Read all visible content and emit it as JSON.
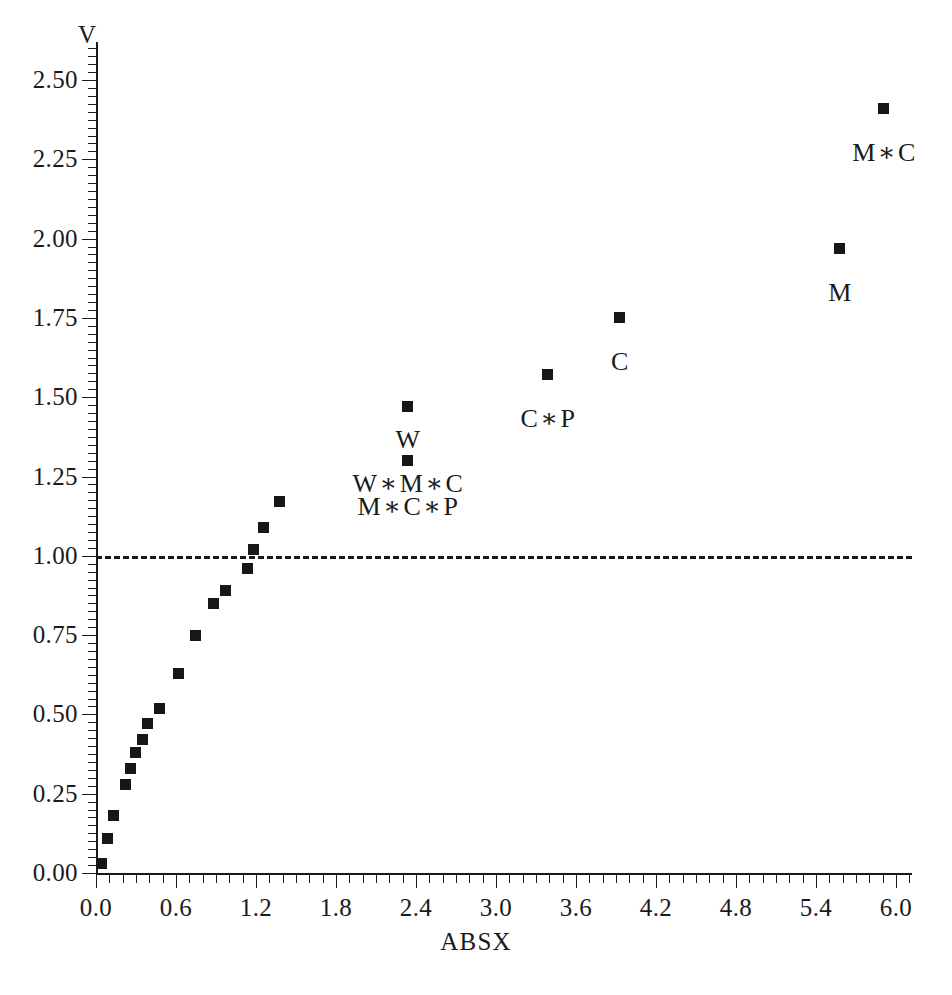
{
  "axes": {
    "ylabel": "V",
    "xlabel": "ABSX",
    "yticks": [
      "0.00",
      "0.25",
      "0.50",
      "0.75",
      "1.00",
      "1.25",
      "1.50",
      "1.75",
      "2.00",
      "2.25",
      "2.50"
    ],
    "xticks": [
      "0.0",
      "0.6",
      "1.2",
      "1.8",
      "2.4",
      "3.0",
      "3.6",
      "4.2",
      "4.8",
      "5.4",
      "6.0"
    ]
  },
  "chart_data": {
    "type": "scatter",
    "title": "",
    "xlabel": "ABSX",
    "ylabel": "V",
    "xlim": [
      0.0,
      6.12
    ],
    "ylim": [
      0.0,
      2.63
    ],
    "xtick_values": [
      0.0,
      0.6,
      1.2,
      1.8,
      2.4,
      3.0,
      3.6,
      4.2,
      4.8,
      5.4,
      6.0
    ],
    "ytick_values": [
      0.0,
      0.25,
      0.5,
      0.75,
      1.0,
      1.25,
      1.5,
      1.75,
      2.0,
      2.25,
      2.5
    ],
    "xtick_labels": [
      "0.0",
      "0.6",
      "1.2",
      "1.8",
      "2.4",
      "3.0",
      "3.6",
      "4.2",
      "4.8",
      "5.4",
      "6.0"
    ],
    "ytick_labels": [
      "0.00",
      "0.25",
      "0.50",
      "0.75",
      "1.00",
      "1.25",
      "1.50",
      "1.75",
      "2.00",
      "2.25",
      "2.50"
    ],
    "minor_ticks": {
      "x_step": 0.1,
      "y_step": 0.025
    },
    "grid": false,
    "legend": "none",
    "marker": "filled-square",
    "marker_color": "#171717",
    "reference_line": {
      "orientation": "horizontal",
      "y": 1.0,
      "style": "dashed",
      "x_from": 0.0,
      "x_to": 6.12,
      "color": "#1a1a1a"
    },
    "points": [
      {
        "x": 0.04,
        "y": 0.03,
        "label": ""
      },
      {
        "x": 0.09,
        "y": 0.11,
        "label": ""
      },
      {
        "x": 0.13,
        "y": 0.18,
        "label": ""
      },
      {
        "x": 0.22,
        "y": 0.28,
        "label": ""
      },
      {
        "x": 0.26,
        "y": 0.33,
        "label": ""
      },
      {
        "x": 0.3,
        "y": 0.38,
        "label": ""
      },
      {
        "x": 0.35,
        "y": 0.42,
        "label": ""
      },
      {
        "x": 0.39,
        "y": 0.47,
        "label": ""
      },
      {
        "x": 0.48,
        "y": 0.52,
        "label": ""
      },
      {
        "x": 0.62,
        "y": 0.63,
        "label": ""
      },
      {
        "x": 0.75,
        "y": 0.75,
        "label": ""
      },
      {
        "x": 0.88,
        "y": 0.85,
        "label": ""
      },
      {
        "x": 0.97,
        "y": 0.89,
        "label": ""
      },
      {
        "x": 1.14,
        "y": 0.96,
        "label": ""
      },
      {
        "x": 1.18,
        "y": 1.02,
        "label": ""
      },
      {
        "x": 1.26,
        "y": 1.09,
        "label": ""
      },
      {
        "x": 1.38,
        "y": 1.17,
        "label": ""
      },
      {
        "x": 2.34,
        "y": 1.3,
        "label": "W * M * C"
      },
      {
        "x": 2.34,
        "y": 1.47,
        "label": "W"
      },
      {
        "x": 3.39,
        "y": 1.57,
        "label": "C * P"
      },
      {
        "x": 3.93,
        "y": 1.75,
        "label": "C"
      },
      {
        "x": 5.58,
        "y": 1.97,
        "label": "M"
      },
      {
        "x": 5.91,
        "y": 2.41,
        "label": "M * C"
      }
    ],
    "annotations": [
      {
        "text": "M * C",
        "x": 5.91,
        "y": 2.27,
        "anchor": "center",
        "for_point": "M * C"
      },
      {
        "text": "M",
        "x": 5.58,
        "y": 1.83,
        "anchor": "center",
        "for_point": "M"
      },
      {
        "text": "C",
        "x": 3.93,
        "y": 1.61,
        "anchor": "center",
        "for_point": "C"
      },
      {
        "text": "C * P",
        "x": 3.39,
        "y": 1.43,
        "anchor": "center",
        "for_point": "C * P"
      },
      {
        "text": "W",
        "x": 2.34,
        "y": 1.365,
        "anchor": "center",
        "for_point": "W"
      },
      {
        "text": "W * M * C",
        "x": 2.34,
        "y": 1.225,
        "anchor": "center",
        "for_point": "W * M * C"
      },
      {
        "text": "M * C * P",
        "x": 2.34,
        "y": 1.155,
        "anchor": "center",
        "for_point": "W * M * C"
      }
    ]
  }
}
